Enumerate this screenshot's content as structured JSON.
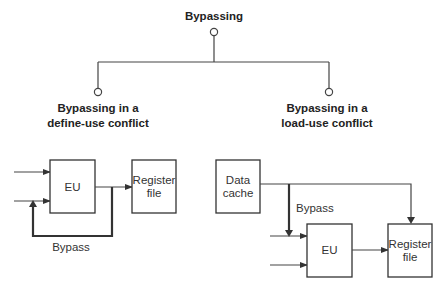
{
  "tree": {
    "root": "Bypassing",
    "children": [
      {
        "line1": "Bypassing in a",
        "line2": "define-use conflict"
      },
      {
        "line1": "Bypassing in a",
        "line2": "load-use conflict"
      }
    ]
  },
  "define_use": {
    "eu": "EU",
    "register_file": {
      "line1": "Register",
      "line2": "file"
    },
    "bypass": "Bypass"
  },
  "load_use": {
    "data_cache": {
      "line1": "Data",
      "line2": "cache"
    },
    "eu": "EU",
    "register_file": {
      "line1": "Register",
      "line2": "file"
    },
    "bypass": "Bypass"
  }
}
